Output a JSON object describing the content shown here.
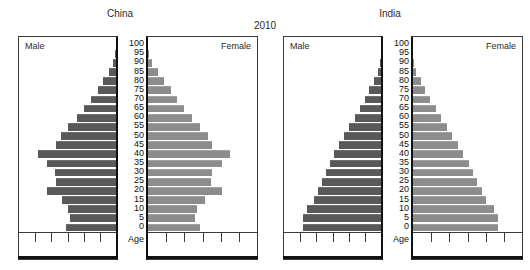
{
  "chart_data": {
    "type": "bar",
    "subtype": "population-pyramid",
    "title": "2010",
    "panel_titles": [
      "China",
      "India"
    ],
    "xlabel": "",
    "ylabel": "Age",
    "grid": false,
    "legend_position": "in-panel",
    "axis_tick_count": 5,
    "age_axis_label": "Age",
    "categories": [
      "0",
      "5",
      "10",
      "15",
      "20",
      "25",
      "30",
      "35",
      "40",
      "45",
      "50",
      "55",
      "60",
      "65",
      "70",
      "75",
      "80",
      "85",
      "90",
      "95",
      "100"
    ],
    "age_labels_top_down": [
      "100",
      "95",
      "90",
      "85",
      "80",
      "75",
      "70",
      "65",
      "60",
      "55",
      "50",
      "45",
      "40",
      "35",
      "30",
      "25",
      "20",
      "15",
      "10",
      "5",
      "0"
    ],
    "colors": {
      "male": "#595959",
      "female": "#8c8c8c",
      "axis": "#111111",
      "panel_border": "#3a3a3a",
      "text": "#2b2b2b"
    },
    "panels": [
      {
        "country": "China",
        "male_label": "Male",
        "female_label": "Female",
        "series": [
          {
            "name": "Male",
            "direction": "left",
            "values": [
              52,
              47,
              49,
              56,
              71,
              62,
              63,
              71,
              80,
              62,
              57,
              49,
              40,
              33,
              26,
              19,
              13,
              7,
              3,
              1,
              0
            ]
          },
          {
            "name": "Female",
            "direction": "right",
            "values": [
              48,
              43,
              45,
              52,
              68,
              58,
              59,
              68,
              75,
              59,
              55,
              48,
              40,
              33,
              27,
              21,
              15,
              9,
              4,
              1,
              0
            ]
          }
        ]
      },
      {
        "country": "India",
        "male_label": "Male",
        "female_label": "Female",
        "series": [
          {
            "name": "Male",
            "direction": "left",
            "values": [
              80,
              80,
              76,
              69,
              65,
              61,
              57,
              53,
              48,
              43,
              38,
              33,
              27,
              22,
              17,
              12,
              7,
              3,
              1,
              0,
              0
            ]
          },
          {
            "name": "Female",
            "direction": "right",
            "values": [
              78,
              78,
              74,
              67,
              63,
              59,
              55,
              51,
              46,
              41,
              36,
              31,
              26,
              21,
              16,
              11,
              7,
              3,
              1,
              0,
              0
            ]
          }
        ]
      }
    ]
  }
}
